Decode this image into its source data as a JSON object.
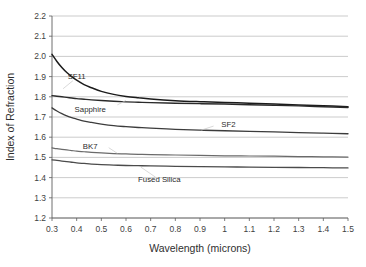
{
  "chart_data": {
    "type": "line",
    "title": "",
    "xlabel": "Wavelength (microns)",
    "ylabel": "Index of Refraction",
    "xlim": [
      0.3,
      1.5
    ],
    "ylim": [
      1.2,
      2.2
    ],
    "grid": true,
    "legend_position": "inline-annotations",
    "x_ticks": [
      "0.3",
      "0.4",
      "0.5",
      "0.6",
      "0.7",
      "0.8",
      "0.9",
      "1",
      "1.1",
      "1.2",
      "1.3",
      "1.4",
      "1.5"
    ],
    "x_tick_values": [
      0.3,
      0.4,
      0.5,
      0.6,
      0.7,
      0.8,
      0.9,
      1.0,
      1.1,
      1.2,
      1.3,
      1.4,
      1.5
    ],
    "y_ticks": [
      "2.2",
      "2.1",
      "2.0",
      "1.9",
      "1.8",
      "1.7",
      "1.6",
      "1.5",
      "1.4",
      "1.3",
      "1.2"
    ],
    "y_tick_values": [
      2.2,
      2.1,
      2.0,
      1.9,
      1.8,
      1.7,
      1.6,
      1.5,
      1.4,
      1.3,
      1.2
    ],
    "x": [
      0.3,
      0.32,
      0.34,
      0.36,
      0.38,
      0.4,
      0.43,
      0.46,
      0.5,
      0.55,
      0.6,
      0.65,
      0.7,
      0.8,
      0.9,
      1.0,
      1.1,
      1.2,
      1.3,
      1.4,
      1.5
    ],
    "series": [
      {
        "name": "SF11",
        "color": "#1b1b1b",
        "width": 1.5,
        "values": [
          2.01,
          1.975,
          1.945,
          1.92,
          1.9,
          1.882,
          1.86,
          1.845,
          1.827,
          1.812,
          1.802,
          1.795,
          1.789,
          1.781,
          1.776,
          1.772,
          1.768,
          1.764,
          1.76,
          1.756,
          1.751
        ],
        "label_x": 0.4,
        "label_y": 1.905,
        "leader": [
          [
            0.385,
            1.88
          ],
          [
            0.345,
            1.84
          ]
        ]
      },
      {
        "name": "Sapphire",
        "color": "#2a2a2a",
        "width": 1.4,
        "values": [
          1.806,
          1.803,
          1.8,
          1.797,
          1.794,
          1.791,
          1.788,
          1.785,
          1.782,
          1.778,
          1.775,
          1.773,
          1.771,
          1.768,
          1.766,
          1.764,
          1.761,
          1.758,
          1.755,
          1.751,
          1.747
        ],
        "label_x": 0.455,
        "label_y": 1.742,
        "leader": [
          [
            0.565,
            1.76
          ],
          [
            0.6,
            1.782
          ]
        ]
      },
      {
        "name": "SF2",
        "color": "#3c3c3c",
        "width": 1.3,
        "values": [
          1.745,
          1.73,
          1.717,
          1.706,
          1.697,
          1.69,
          1.68,
          1.673,
          1.665,
          1.657,
          1.652,
          1.648,
          1.645,
          1.639,
          1.635,
          1.632,
          1.629,
          1.626,
          1.623,
          1.62,
          1.617
        ],
        "label_x": 1.015,
        "label_y": 1.665,
        "leader": [
          [
            0.955,
            1.655
          ],
          [
            0.905,
            1.635
          ]
        ]
      },
      {
        "name": "BK7",
        "color": "#6a6a6a",
        "width": 1.2,
        "values": [
          1.547,
          1.543,
          1.54,
          1.537,
          1.534,
          1.531,
          1.528,
          1.525,
          1.522,
          1.519,
          1.517,
          1.515,
          1.514,
          1.512,
          1.51,
          1.508,
          1.507,
          1.506,
          1.504,
          1.503,
          1.501
        ],
        "label_x": 0.455,
        "label_y": 1.556,
        "leader": [
          [
            0.53,
            1.548
          ],
          [
            0.565,
            1.52
          ]
        ]
      },
      {
        "name": "Fused Silica",
        "color": "#4b4b4b",
        "width": 1.3,
        "values": [
          1.488,
          1.485,
          1.482,
          1.479,
          1.476,
          1.473,
          1.47,
          1.467,
          1.464,
          1.462,
          1.46,
          1.459,
          1.458,
          1.456,
          1.454,
          1.453,
          1.452,
          1.451,
          1.45,
          1.449,
          1.448
        ],
        "label_x": 0.735,
        "label_y": 1.392,
        "leader": [
          [
            0.72,
            1.402
          ],
          [
            0.66,
            1.452
          ]
        ]
      }
    ]
  },
  "layout": {
    "plot_left": 52,
    "plot_right": 348,
    "plot_top": 16,
    "plot_bottom": 218
  }
}
